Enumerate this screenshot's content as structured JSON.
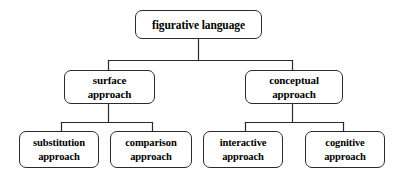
{
  "diagram": {
    "type": "hierarchy-tree",
    "orientation": "top-down",
    "levels": 3,
    "style": {
      "background_color": "#ffffff",
      "box_fill_color": "#ffffff",
      "box_border_color": "#2b2b2b",
      "connector_color": "#2b2b2b",
      "text_color": "#000000"
    },
    "nodes": {
      "root": {
        "label": "figurative language",
        "lines": [
          "figurative language"
        ]
      },
      "surface": {
        "label": "surface approach",
        "lines": [
          "surface",
          "approach"
        ]
      },
      "conceptual": {
        "label": "conceptual approach",
        "lines": [
          "conceptual",
          "approach"
        ]
      },
      "substitution": {
        "label": "substitution approach",
        "lines": [
          "substitution",
          "approach"
        ]
      },
      "comparison": {
        "label": "comparison approach",
        "lines": [
          "comparison",
          "approach"
        ]
      },
      "interactive": {
        "label": "interactive approach",
        "lines": [
          "interactive",
          "approach"
        ]
      },
      "cognitive": {
        "label": "cognitive approach",
        "lines": [
          "cognitive",
          "approach"
        ]
      }
    },
    "edges": [
      {
        "from": "root",
        "to": "surface"
      },
      {
        "from": "root",
        "to": "conceptual"
      },
      {
        "from": "surface",
        "to": "substitution"
      },
      {
        "from": "surface",
        "to": "comparison"
      },
      {
        "from": "conceptual",
        "to": "interactive"
      },
      {
        "from": "conceptual",
        "to": "cognitive"
      }
    ]
  }
}
